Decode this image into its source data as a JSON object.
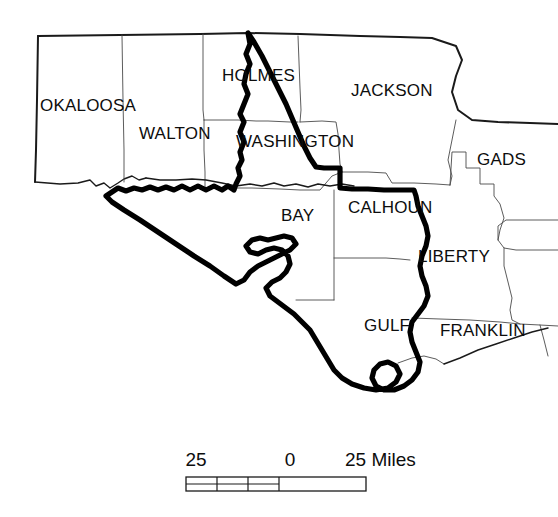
{
  "figure": {
    "kind": "reference-map",
    "region": "Florida Panhandle",
    "background_color": "#ffffff",
    "line_color": "#1a1a1a",
    "county_line_color": "#4a4a4a",
    "highlight_color": "#000000"
  },
  "counties": [
    {
      "id": "okaloosa",
      "label": "OKALOOSA",
      "x": 40,
      "y": 111
    },
    {
      "id": "walton",
      "label": "WALTON",
      "x": 139,
      "y": 139
    },
    {
      "id": "holmes",
      "label": "HOLMES",
      "x": 222,
      "y": 81
    },
    {
      "id": "jackson",
      "label": "JACKSON",
      "x": 351,
      "y": 96
    },
    {
      "id": "washington",
      "label": "WASHINGTON",
      "x": 236,
      "y": 147
    },
    {
      "id": "gadsden",
      "label": "GADS",
      "x": 477,
      "y": 165
    },
    {
      "id": "bay",
      "label": "BAY",
      "x": 281,
      "y": 221
    },
    {
      "id": "calhoun",
      "label": "CALHOUN",
      "x": 348,
      "y": 213
    },
    {
      "id": "liberty",
      "label": "LIBERTY",
      "x": 418,
      "y": 262
    },
    {
      "id": "gulf",
      "label": "GULF",
      "x": 364,
      "y": 331
    },
    {
      "id": "franklin",
      "label": "FRANKLIN",
      "x": 440,
      "y": 336
    }
  ],
  "scale_bar": {
    "unit_label": "Miles",
    "left_label": "25",
    "center_label": "0",
    "right_label": "25 Miles",
    "labels": [
      {
        "text": "25",
        "x": 196,
        "y": 466
      },
      {
        "text": "0",
        "x": 290,
        "y": 466
      },
      {
        "text": "25 Miles",
        "x": 345,
        "y": 466
      }
    ],
    "bar": {
      "x": 186,
      "y": 477,
      "width": 180,
      "height": 14,
      "divisions": 3,
      "division_width": 31,
      "has_midline": true
    }
  }
}
